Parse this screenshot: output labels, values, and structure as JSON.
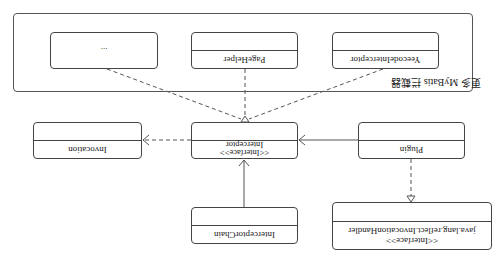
{
  "diagram": {
    "orientation": "rotated-180",
    "group": {
      "label": "更多 MyBatis 拦截器"
    },
    "classes": {
      "ellipsis": {
        "name": "..."
      },
      "page_helper": {
        "name": "PageHelper"
      },
      "yeecode_interceptor": {
        "name": "YeecodeInterceptor"
      },
      "invocation": {
        "name": "Invocation"
      },
      "interceptor": {
        "stereotype": "<<Interface>>",
        "name": "Interceptor"
      },
      "plugin": {
        "name": "Plugin"
      },
      "interceptor_chain": {
        "name": "InterceptorChain"
      },
      "invocation_handler": {
        "stereotype": "<<Interface>>",
        "name": "java.lang.reflect.InvocationHandler"
      }
    },
    "relations": [
      {
        "from": "...",
        "to": "Interceptor",
        "type": "realization"
      },
      {
        "from": "PageHelper",
        "to": "Interceptor",
        "type": "realization"
      },
      {
        "from": "YeecodeInterceptor",
        "to": "Interceptor",
        "type": "realization"
      },
      {
        "from": "Interceptor",
        "to": "Invocation",
        "type": "dependency"
      },
      {
        "from": "Plugin",
        "to": "Interceptor",
        "type": "association"
      },
      {
        "from": "InterceptorChain",
        "to": "Interceptor",
        "type": "association"
      },
      {
        "from": "Plugin",
        "to": "java.lang.reflect.InvocationHandler",
        "type": "realization"
      }
    ]
  }
}
